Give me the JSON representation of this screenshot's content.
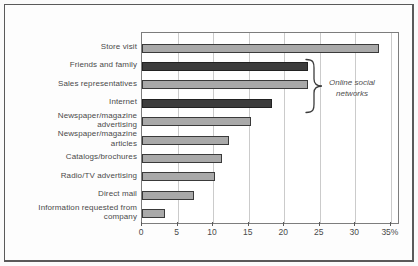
{
  "chart_data": {
    "type": "bar",
    "orientation": "horizontal",
    "title": "",
    "xlabel": "",
    "ylabel": "",
    "categories": [
      "Store visit",
      "Friends and family",
      "Sales representatives",
      "Internet",
      "Newspaper/magazine advertising",
      "Newspaper/magazine articles",
      "Catalogs/brochures",
      "Radio/TV advertising",
      "Direct mail",
      "Information requested from company"
    ],
    "category_label_lines": [
      [
        "Store visit"
      ],
      [
        "Friends and family"
      ],
      [
        "Sales representatives"
      ],
      [
        "Internet"
      ],
      [
        "Newspaper/magazine",
        "advertising"
      ],
      [
        "Newspaper/magazine",
        "articles"
      ],
      [
        "Catalogs/brochures"
      ],
      [
        "Radio/TV advertising"
      ],
      [
        "Direct mail"
      ],
      [
        "Information requested from",
        "company"
      ]
    ],
    "values": [
      33,
      23,
      23,
      18,
      15,
      12,
      11,
      10,
      7,
      3
    ],
    "bar_styles": [
      "light",
      "dark",
      "light",
      "dark",
      "light",
      "light",
      "light",
      "light",
      "light",
      "light"
    ],
    "x_ticks": [
      0,
      5,
      10,
      15,
      20,
      25,
      30,
      35
    ],
    "x_tick_labels": [
      "0",
      "5",
      "10",
      "15",
      "20",
      "25",
      "30",
      "35%"
    ],
    "x_max": 36,
    "xlim": [
      0,
      35
    ],
    "grid": true,
    "legend": "none",
    "annotation": {
      "lines": [
        "Online social",
        "networks"
      ],
      "grouped_categories": [
        "Friends and family",
        "Sales representatives",
        "Internet"
      ]
    },
    "colors": {
      "light_bar": "#a9a9a9",
      "dark_bar": "#3d3d3d",
      "bar_border": "#3a3a3a",
      "gridline": "#cbcbcb",
      "plot_border": "#7d7d7d",
      "frame_border": "#5a5a5a",
      "text": "#4a4a4a"
    }
  }
}
